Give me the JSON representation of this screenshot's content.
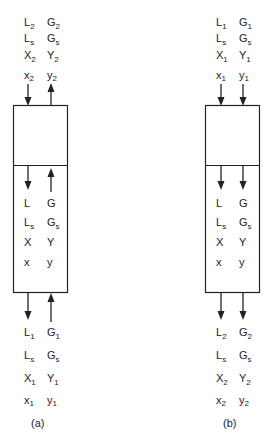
{
  "figure": {
    "colors": {
      "ink": "#222222",
      "background": "#ffffff"
    },
    "panels": [
      {
        "id": "a",
        "caption": "(a)",
        "top_labels": [
          {
            "left": "L",
            "left_sub": "2",
            "right": "G",
            "right_sub": "2"
          },
          {
            "left": "L",
            "left_sub": "s",
            "right": "G",
            "right_sub": "s"
          },
          {
            "left": "X",
            "left_sub": "2",
            "right": "Y",
            "right_sub": "2"
          },
          {
            "left": "x",
            "left_sub": "2",
            "right": "y",
            "right_sub": "2"
          }
        ],
        "middle_labels": [
          {
            "left": "L",
            "left_sub": "",
            "right": "G",
            "right_sub": ""
          },
          {
            "left": "L",
            "left_sub": "s",
            "right": "G",
            "right_sub": "s"
          },
          {
            "left": "X",
            "left_sub": "",
            "right": "Y",
            "right_sub": ""
          },
          {
            "left": "x",
            "left_sub": "",
            "right": "y",
            "right_sub": ""
          }
        ],
        "bottom_labels": [
          {
            "left": "L",
            "left_sub": "1",
            "right": "G",
            "right_sub": "1"
          },
          {
            "left": "L",
            "left_sub": "s",
            "right": "G",
            "right_sub": "s"
          },
          {
            "left": "X",
            "left_sub": "1",
            "right": "Y",
            "right_sub": "1"
          },
          {
            "left": "x",
            "left_sub": "1",
            "right": "y",
            "right_sub": "1"
          }
        ],
        "flow": {
          "liquid": "down",
          "gas": "up"
        }
      },
      {
        "id": "b",
        "caption": "(b)",
        "top_labels": [
          {
            "left": "L",
            "left_sub": "1",
            "right": "G",
            "right_sub": "1"
          },
          {
            "left": "L",
            "left_sub": "s",
            "right": "G",
            "right_sub": "s"
          },
          {
            "left": "X",
            "left_sub": "1",
            "right": "Y",
            "right_sub": "1"
          },
          {
            "left": "x",
            "left_sub": "1",
            "right": "y",
            "right_sub": "1"
          }
        ],
        "middle_labels": [
          {
            "left": "L",
            "left_sub": "",
            "right": "G",
            "right_sub": ""
          },
          {
            "left": "L",
            "left_sub": "s",
            "right": "G",
            "right_sub": "s"
          },
          {
            "left": "X",
            "left_sub": "",
            "right": "Y",
            "right_sub": ""
          },
          {
            "left": "x",
            "left_sub": "",
            "right": "y",
            "right_sub": ""
          }
        ],
        "bottom_labels": [
          {
            "left": "L",
            "left_sub": "2",
            "right": "G",
            "right_sub": "2"
          },
          {
            "left": "L",
            "left_sub": "s",
            "right": "G",
            "right_sub": "s"
          },
          {
            "left": "X",
            "left_sub": "2",
            "right": "Y",
            "right_sub": "2"
          },
          {
            "left": "x",
            "left_sub": "2",
            "right": "y",
            "right_sub": "2"
          }
        ],
        "flow": {
          "liquid": "down",
          "gas": "down"
        }
      }
    ]
  }
}
